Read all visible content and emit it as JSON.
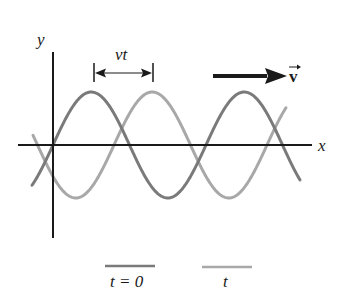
{
  "diagram": {
    "axes": {
      "x_label": "x",
      "y_label": "y"
    },
    "displacement": {
      "label": "vt"
    },
    "velocity": {
      "label": "v",
      "vector": true
    },
    "legend": [
      {
        "label": "t = 0",
        "color": "#7a7a7a"
      },
      {
        "label": "t",
        "color": "#a8a8a8"
      }
    ],
    "colors": {
      "axis": "#1a1a1a",
      "wave_t0": "#7a7a7a",
      "wave_t": "#a8a8a8",
      "arrow": "#1a1a1a"
    }
  },
  "chart_data": {
    "type": "line",
    "title": "",
    "xlabel": "x",
    "ylabel": "y",
    "series": [
      {
        "name": "t = 0",
        "function": "y = A sin(2π(x - x0)/λ)",
        "phase_shift_px": 0,
        "wavelength_px": 153,
        "amplitude_px": 53,
        "x_start": 32,
        "x_end": 300,
        "origin_x": 53
      },
      {
        "name": "t",
        "function": "y = A sin(2π(x - x0 - vt)/λ)",
        "phase_shift_px": 61,
        "wavelength_px": 153,
        "amplitude_px": 53,
        "x_start": 33,
        "x_end": 286,
        "origin_x": 53
      }
    ],
    "annotations": [
      "vt",
      "v (velocity vector)"
    ],
    "grid": false
  }
}
